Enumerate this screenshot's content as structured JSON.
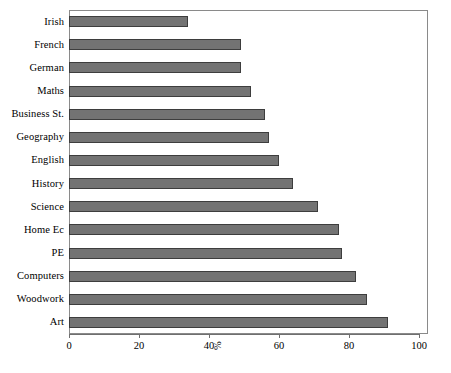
{
  "chart_data": {
    "type": "bar",
    "orientation": "horizontal",
    "title": "",
    "subtitle": "",
    "xlabel": "%",
    "ylabel": "",
    "xlim": [
      0,
      100
    ],
    "xticks": [
      0,
      20,
      40,
      60,
      80,
      100
    ],
    "xtick_labels": [
      "0",
      "20",
      "40",
      "60",
      "80",
      "100"
    ],
    "grid": false,
    "legend": false,
    "legend_position": "none",
    "bar_color": "#737373",
    "bar_edge_color": "#3d3d3d",
    "frame_color": "#8a8a8a",
    "background_color": "#ffffff",
    "categories": [
      "Irish",
      "French",
      "German",
      "Maths",
      "Business St.",
      "Geography",
      "English",
      "History",
      "Science",
      "Home Ec",
      "PE",
      "Computers",
      "Woodwork",
      "Art"
    ],
    "values": [
      34,
      49,
      49,
      52,
      56,
      57,
      60,
      64,
      71,
      77,
      78,
      82,
      85,
      91
    ]
  }
}
